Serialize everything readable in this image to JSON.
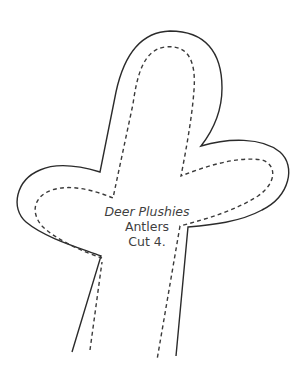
{
  "pattern": {
    "title": "Deer Plushies",
    "piece_name": "Antlers",
    "instruction": "Cut 4.",
    "colors": {
      "background": "#ffffff",
      "cut_line": "#2b2b2b",
      "sew_line": "#3a3a3a",
      "text": "#3f3f3f"
    },
    "legend": {
      "solid_line": "cut-line",
      "dashed_line": "sewing-line"
    }
  }
}
